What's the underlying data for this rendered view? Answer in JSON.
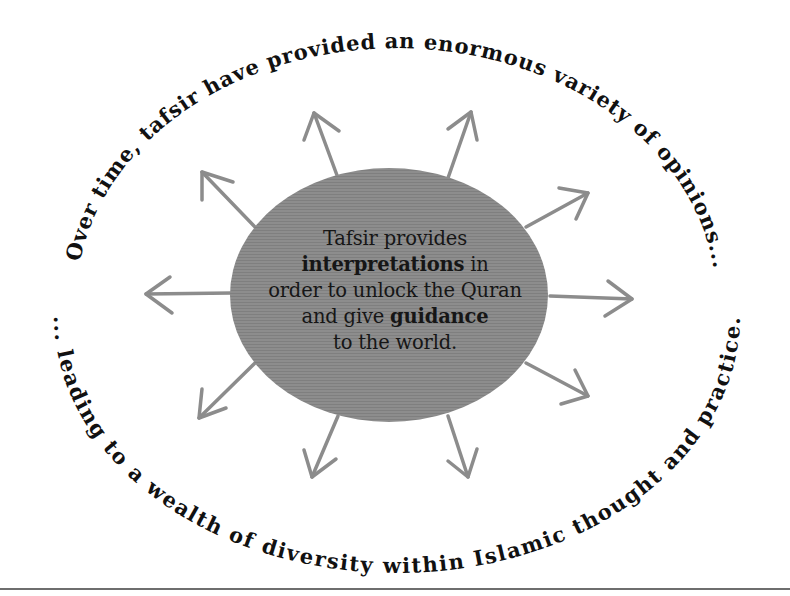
{
  "diagram": {
    "center": {
      "lines": [
        {
          "parts": [
            {
              "text": "Tafsir provides",
              "bold": false
            }
          ]
        },
        {
          "parts": [
            {
              "text": "interpretations",
              "bold": true
            },
            {
              "text": " in",
              "bold": false
            }
          ]
        },
        {
          "parts": [
            {
              "text": "order to unlock the Quran",
              "bold": false
            }
          ]
        },
        {
          "parts": [
            {
              "text": "and give ",
              "bold": false
            },
            {
              "text": "guidance",
              "bold": true
            }
          ]
        },
        {
          "parts": [
            {
              "text": "to the world.",
              "bold": false
            }
          ]
        }
      ],
      "line1": "Tafsir provides",
      "line2_bold": "interpretations",
      "line2_rest": " in",
      "line3": "order to unlock the Quran",
      "line4_start": "and give ",
      "line4_bold": "guidance",
      "line5": "to the world."
    },
    "top_arc_text": "Over time, tafsir have provided an enormous variety of opinions...",
    "bottom_arc_text": "... leading to a wealth of diversity within Islamic thought and practice.",
    "arrow_count": 10,
    "colors": {
      "ellipse_fill": "#8a8a8a",
      "arrow_stroke": "#8c8c8c",
      "text": "#111111",
      "rule": "#6e6e6e"
    }
  }
}
